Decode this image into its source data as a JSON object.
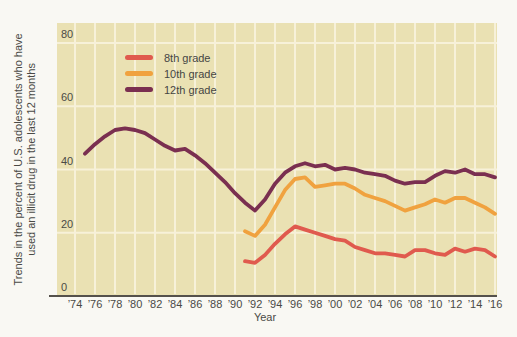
{
  "chart_data": {
    "type": "line",
    "title": "",
    "xlabel": "Year",
    "ylabel": "Trends in the percent of U.S. adolescents who have used an illicit drug in the last 12 months",
    "ylim": [
      0,
      80
    ],
    "yticks": [
      0,
      20,
      40,
      60,
      80
    ],
    "xtick_years": [
      1974,
      1976,
      1978,
      1980,
      1982,
      1984,
      1986,
      1988,
      1990,
      1992,
      1994,
      1996,
      1998,
      2000,
      2002,
      2004,
      2006,
      2008,
      2010,
      2012,
      2014,
      2016
    ],
    "xtick_labels": [
      "’74",
      "’76",
      "’78",
      "’80",
      "’82",
      "’84",
      "’86",
      "’88",
      "’90",
      "’92",
      "’94",
      "’96",
      "’98",
      "’00",
      "’02",
      "’04",
      "’06",
      "’08",
      "’10",
      "’12",
      "’14",
      "’16"
    ],
    "grid": true,
    "legend_position": "top-left-inside",
    "plot_background_color": "#eae1b3",
    "gridline_color": "#f7f1d9",
    "axis_line_color": "#55514b",
    "text_color": "#4a4a46",
    "page_background_color": "#f9f8f3",
    "series": [
      {
        "name": "8th grade",
        "color": "#e05a4e",
        "points": [
          [
            1991,
            11
          ],
          [
            1992,
            10.5
          ],
          [
            1993,
            13
          ],
          [
            1994,
            16.5
          ],
          [
            1995,
            19.5
          ],
          [
            1996,
            22
          ],
          [
            1997,
            21
          ],
          [
            1998,
            20
          ],
          [
            1999,
            19
          ],
          [
            2000,
            18
          ],
          [
            2001,
            17.5
          ],
          [
            2002,
            15.5
          ],
          [
            2003,
            14.5
          ],
          [
            2004,
            13.5
          ],
          [
            2005,
            13.5
          ],
          [
            2006,
            13
          ],
          [
            2007,
            12.5
          ],
          [
            2008,
            14.5
          ],
          [
            2009,
            14.5
          ],
          [
            2010,
            13.5
          ],
          [
            2011,
            13
          ],
          [
            2012,
            15
          ],
          [
            2013,
            14
          ],
          [
            2014,
            15
          ],
          [
            2015,
            14.5
          ],
          [
            2016,
            12.5
          ]
        ]
      },
      {
        "name": "10th grade",
        "color": "#f0a23f",
        "points": [
          [
            1991,
            20.5
          ],
          [
            1992,
            19
          ],
          [
            1993,
            22.5
          ],
          [
            1994,
            28
          ],
          [
            1995,
            33.5
          ],
          [
            1996,
            37
          ],
          [
            1997,
            37.5
          ],
          [
            1998,
            34.5
          ],
          [
            1999,
            35
          ],
          [
            2000,
            35.5
          ],
          [
            2001,
            35.5
          ],
          [
            2002,
            34
          ],
          [
            2003,
            32
          ],
          [
            2004,
            31
          ],
          [
            2005,
            30
          ],
          [
            2006,
            28.5
          ],
          [
            2007,
            27
          ],
          [
            2008,
            28
          ],
          [
            2009,
            29
          ],
          [
            2010,
            30.5
          ],
          [
            2011,
            29.5
          ],
          [
            2012,
            31
          ],
          [
            2013,
            31
          ],
          [
            2014,
            29.5
          ],
          [
            2015,
            28
          ],
          [
            2016,
            26
          ]
        ]
      },
      {
        "name": "12th grade",
        "color": "#7a2f50",
        "points": [
          [
            1975,
            45
          ],
          [
            1976,
            48
          ],
          [
            1977,
            50.5
          ],
          [
            1978,
            52.5
          ],
          [
            1979,
            53
          ],
          [
            1980,
            52.5
          ],
          [
            1981,
            51.5
          ],
          [
            1982,
            49.5
          ],
          [
            1983,
            47.5
          ],
          [
            1984,
            46
          ],
          [
            1985,
            46.5
          ],
          [
            1986,
            44.5
          ],
          [
            1987,
            42
          ],
          [
            1988,
            39
          ],
          [
            1989,
            36
          ],
          [
            1990,
            32.5
          ],
          [
            1991,
            29.5
          ],
          [
            1992,
            27
          ],
          [
            1993,
            30.5
          ],
          [
            1994,
            35.5
          ],
          [
            1995,
            39
          ],
          [
            1996,
            41
          ],
          [
            1997,
            42
          ],
          [
            1998,
            41
          ],
          [
            1999,
            41.5
          ],
          [
            2000,
            40
          ],
          [
            2001,
            40.5
          ],
          [
            2002,
            40
          ],
          [
            2003,
            39
          ],
          [
            2004,
            38.5
          ],
          [
            2005,
            38
          ],
          [
            2006,
            36.5
          ],
          [
            2007,
            35.5
          ],
          [
            2008,
            36
          ],
          [
            2009,
            36
          ],
          [
            2010,
            38
          ],
          [
            2011,
            39.5
          ],
          [
            2012,
            39
          ],
          [
            2013,
            40
          ],
          [
            2014,
            38.5
          ],
          [
            2015,
            38.5
          ],
          [
            2016,
            37.5
          ]
        ]
      }
    ]
  }
}
